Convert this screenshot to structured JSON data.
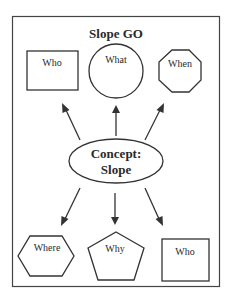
{
  "diagram": {
    "title": "Slope GO",
    "center": {
      "line1": "Concept:",
      "line2": "Slope",
      "shape": "ellipse"
    },
    "top_nodes": [
      {
        "label": "Who",
        "shape": "rectangle"
      },
      {
        "label": "What",
        "shape": "circle"
      },
      {
        "label": "When",
        "shape": "octagon"
      }
    ],
    "bottom_nodes": [
      {
        "label": "Where",
        "shape": "hexagon"
      },
      {
        "label": "Why",
        "shape": "pentagon"
      },
      {
        "label": "Who",
        "shape": "square"
      }
    ],
    "colors": {
      "stroke": "#333333",
      "background": "#ffffff",
      "text": "#2a2a2a"
    }
  }
}
